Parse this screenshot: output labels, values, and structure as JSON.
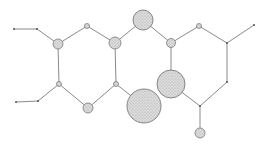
{
  "diagram": {
    "type": "molecular-structure",
    "colors": {
      "background": "#ffffff",
      "bond": "#8a8a8a",
      "atom_fill": "#d4d4d4",
      "atom_stroke": "#7a7a7a",
      "terminal": "#555555"
    },
    "atoms": [
      {
        "id": "a1",
        "x": 58,
        "y": 44,
        "r": 5
      },
      {
        "id": "a2",
        "x": 87,
        "y": 26,
        "r": 2.5
      },
      {
        "id": "a3",
        "x": 115,
        "y": 43,
        "r": 6
      },
      {
        "id": "a4",
        "x": 59,
        "y": 84,
        "r": 2.5
      },
      {
        "id": "a5",
        "x": 88,
        "y": 108,
        "r": 5
      },
      {
        "id": "a6",
        "x": 116,
        "y": 84,
        "r": 2.5
      },
      {
        "id": "a7",
        "x": 143,
        "y": 20,
        "r": 10
      },
      {
        "id": "a8",
        "x": 171,
        "y": 43,
        "r": 4.5
      },
      {
        "id": "a9",
        "x": 199,
        "y": 26,
        "r": 2.5
      },
      {
        "id": "a10",
        "x": 171,
        "y": 84,
        "r": 14
      },
      {
        "id": "a11",
        "x": 144,
        "y": 106,
        "r": 17
      },
      {
        "id": "a12",
        "x": 200,
        "y": 133,
        "r": 5
      }
    ],
    "points": [
      {
        "id": "p1",
        "x": 14,
        "y": 29
      },
      {
        "id": "p2",
        "x": 37,
        "y": 29
      },
      {
        "id": "p3",
        "x": 16,
        "y": 102
      },
      {
        "id": "p4",
        "x": 38,
        "y": 101
      },
      {
        "id": "p5",
        "x": 227,
        "y": 43
      },
      {
        "id": "p6",
        "x": 254,
        "y": 25
      },
      {
        "id": "p7",
        "x": 227,
        "y": 82
      },
      {
        "id": "p8",
        "x": 200,
        "y": 106
      }
    ],
    "bonds": [
      [
        "p1",
        "p2"
      ],
      [
        "p2",
        "a1"
      ],
      [
        "a1",
        "a2"
      ],
      [
        "a2",
        "a3"
      ],
      [
        "a1",
        "a4"
      ],
      [
        "a3",
        "a6"
      ],
      [
        "p3",
        "p4"
      ],
      [
        "p4",
        "a4"
      ],
      [
        "a4",
        "a5"
      ],
      [
        "a5",
        "a6"
      ],
      [
        "a3",
        "a7"
      ],
      [
        "a7",
        "a8"
      ],
      [
        "a8",
        "a9"
      ],
      [
        "a9",
        "p5"
      ],
      [
        "p5",
        "p6"
      ],
      [
        "a8",
        "a10"
      ],
      [
        "a6",
        "a11"
      ],
      [
        "a10",
        "p8"
      ],
      [
        "p5",
        "p7"
      ],
      [
        "p7",
        "p8"
      ],
      [
        "p8",
        "a12"
      ]
    ]
  }
}
